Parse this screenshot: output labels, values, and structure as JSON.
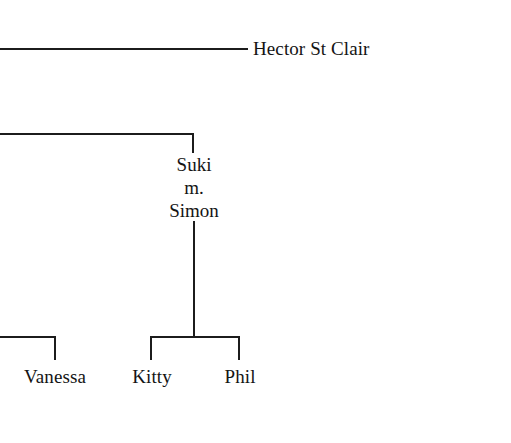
{
  "diagram": {
    "type": "family-tree",
    "background_color": "#ffffff",
    "line_color": "#1c1c1c",
    "text_color": "#141414",
    "canvas": {
      "width": 511,
      "height": 443
    }
  },
  "people": {
    "hector": {
      "label": "Hector St Clair"
    },
    "suki": {
      "label": "Suki"
    },
    "marriage_marker": {
      "label": "m."
    },
    "simon": {
      "label": "Simon"
    },
    "vanessa": {
      "label": "Vanessa"
    },
    "kitty": {
      "label": "Kitty"
    },
    "phil": {
      "label": "Phil"
    }
  },
  "generations": [
    {
      "level": 1,
      "members": [
        "Hector St Clair"
      ]
    },
    {
      "level": 2,
      "members": [
        "Suki",
        "Simon"
      ],
      "union": "m."
    },
    {
      "level": 3,
      "members": [
        "Vanessa",
        "Kitty",
        "Phil"
      ]
    }
  ],
  "connectors": [
    {
      "name": "hector-spouse-line",
      "orientation": "horizontal"
    },
    {
      "name": "suki-sibling-bar",
      "orientation": "horizontal"
    },
    {
      "name": "suki-drop",
      "orientation": "vertical"
    },
    {
      "name": "simon-descender",
      "orientation": "vertical"
    },
    {
      "name": "children-bar",
      "orientation": "horizontal"
    },
    {
      "name": "kitty-drop",
      "orientation": "vertical"
    },
    {
      "name": "phil-drop",
      "orientation": "vertical"
    },
    {
      "name": "vanessa-bar",
      "orientation": "horizontal"
    },
    {
      "name": "vanessa-drop",
      "orientation": "vertical"
    }
  ]
}
